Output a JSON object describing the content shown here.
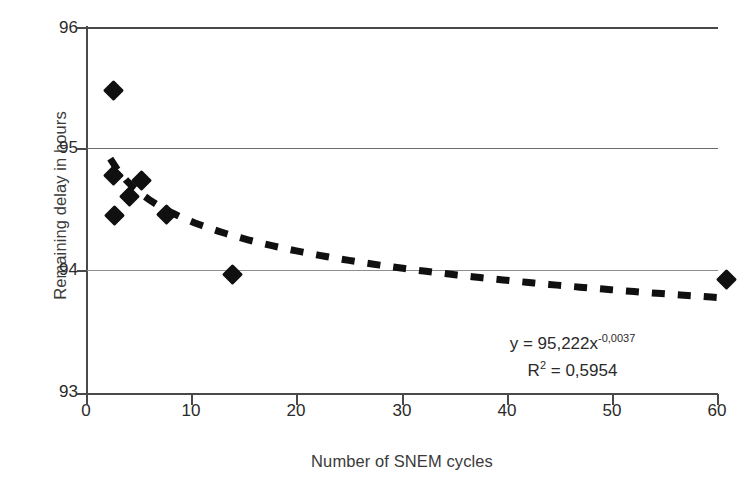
{
  "chart_data": {
    "type": "scatter",
    "title": "",
    "xlabel": "Number of SNEM cycles",
    "ylabel": "Remaining delay in hours",
    "xlim": [
      0,
      60
    ],
    "ylim": [
      93,
      96
    ],
    "xticks": [
      "0",
      "10",
      "20",
      "30",
      "40",
      "50",
      "60"
    ],
    "yticks": [
      "93",
      "94",
      "95",
      "96"
    ],
    "grid": true,
    "legend": "none",
    "marker": "filled-diamond",
    "marker_color": "#111010",
    "points": [
      {
        "x": 2.6,
        "y": 95.49
      },
      {
        "x": 2.7,
        "y": 94.46
      },
      {
        "x": 2.6,
        "y": 94.79
      },
      {
        "x": 4.1,
        "y": 94.62
      },
      {
        "x": 5.3,
        "y": 94.75
      },
      {
        "x": 7.6,
        "y": 94.47
      },
      {
        "x": 13.9,
        "y": 93.98
      },
      {
        "x": 60.8,
        "y": 93.94
      }
    ],
    "trendline": {
      "type": "power",
      "style": "dotted",
      "color": "#111010",
      "coefficient": 95.222,
      "exponent": -0.0037,
      "x_start": 2.3,
      "x_end": 60.8,
      "equation_label": "y = 95,222x",
      "equation_exponent": "-0,0037",
      "r2_label": "R",
      "r2_superscript": "2",
      "r2_value": " = 0,5954"
    }
  },
  "annotations": {
    "equation_line1_base": "y = 95,222x",
    "equation_line1_sup": "-0,0037",
    "equation_line2_base": "R",
    "equation_line2_sup": "2",
    "equation_line2_tail": " = 0,5954"
  }
}
